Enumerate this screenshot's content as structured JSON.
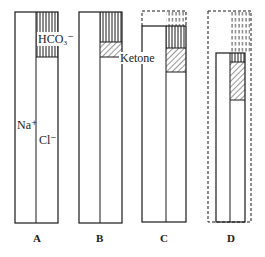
{
  "figure": {
    "type": "ion-gap gamblegram",
    "ion_labels": {
      "sodium": "Na⁺",
      "chloride": "Cl⁻",
      "bicarbonate": "HCO₃⁻",
      "ketone": "Ketone"
    },
    "panels": [
      {
        "label": "A",
        "description": "normal: Na+ column vs Cl- + HCO3- column"
      },
      {
        "label": "B",
        "description": "ketone partially replaces HCO3-"
      },
      {
        "label": "C",
        "description": "expanded (dashed) column; larger ketone fraction"
      },
      {
        "label": "D",
        "description": "contracted volume (dashed outline); ketone dominant, little HCO3-"
      }
    ]
  },
  "colors": {
    "line": "#1a1a1a",
    "background": "#ffffff"
  }
}
